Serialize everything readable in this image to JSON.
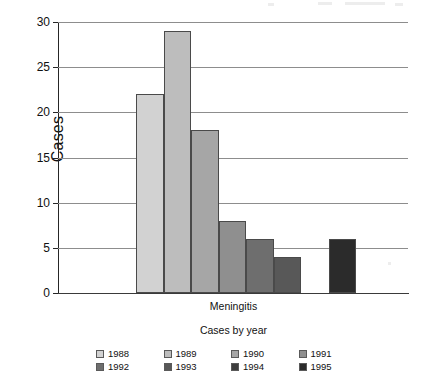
{
  "chart_data": {
    "type": "bar",
    "title": "",
    "xlabel": "Cases by year",
    "ylabel": "Cases",
    "categories": [
      "Meningitis"
    ],
    "category_label": "Meningitis",
    "ylim": [
      0,
      30
    ],
    "yticks": [
      0,
      5,
      10,
      15,
      20,
      25,
      30
    ],
    "ytick_labels": [
      "0",
      "5",
      "10",
      "15",
      "20",
      "25",
      "30"
    ],
    "grid": true,
    "legend_position": "bottom",
    "series": [
      {
        "name": "1988",
        "values": [
          22
        ],
        "color": "#d2d2d2"
      },
      {
        "name": "1989",
        "values": [
          29
        ],
        "color": "#bdbdbd"
      },
      {
        "name": "1990",
        "values": [
          18
        ],
        "color": "#a6a6a6"
      },
      {
        "name": "1991",
        "values": [
          8
        ],
        "color": "#8f8f8f"
      },
      {
        "name": "1992",
        "values": [
          6
        ],
        "color": "#6e6e6e"
      },
      {
        "name": "1993",
        "values": [
          4
        ],
        "color": "#585858"
      },
      {
        "name": "1994",
        "values": [
          0
        ],
        "color": "#3d3d3d"
      },
      {
        "name": "1995",
        "values": [
          6
        ],
        "color": "#2b2b2b"
      }
    ]
  },
  "legend": {
    "rows": [
      [
        {
          "label": "1988",
          "color": "#d2d2d2"
        },
        {
          "label": "1989",
          "color": "#bdbdbd"
        },
        {
          "label": "1990",
          "color": "#a6a6a6"
        },
        {
          "label": "1991",
          "color": "#8f8f8f"
        }
      ],
      [
        {
          "label": "1992",
          "color": "#6e6e6e"
        },
        {
          "label": "1993",
          "color": "#585858"
        },
        {
          "label": "1994",
          "color": "#3d3d3d"
        },
        {
          "label": "1995",
          "color": "#2b2b2b"
        }
      ]
    ]
  }
}
